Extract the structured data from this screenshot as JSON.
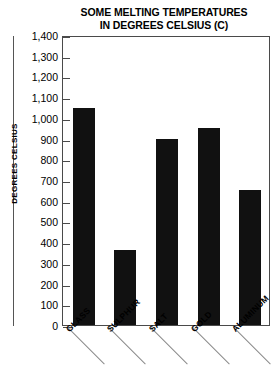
{
  "chart_data": {
    "type": "bar",
    "title": "SOME MELTING TEMPERATURES IN DEGREES CELSIUS (C)",
    "title_line1": "SOME MELTING TEMPERATURES",
    "title_line2": "IN DEGREES CELSIUS (C)",
    "categories": [
      "GLASS",
      "SULPHUR",
      "SALT",
      "GOLD",
      "ALUMINUM"
    ],
    "values": [
      1050,
      360,
      900,
      950,
      650
    ],
    "xlabel": "",
    "ylabel": "DEGREES CELSIUS",
    "ylim": [
      0,
      1400
    ],
    "ytick_step": 100,
    "ytick_labels": [
      "1,400",
      "1,300",
      "1,200",
      "1,100",
      "1,000",
      "900",
      "800",
      "700",
      "600",
      "500",
      "400",
      "300",
      "200",
      "100",
      "0"
    ],
    "ytick_values": [
      1400,
      1300,
      1200,
      1100,
      1000,
      900,
      800,
      700,
      600,
      500,
      400,
      300,
      200,
      100,
      0
    ],
    "grid": false,
    "legend": "none",
    "bar_color": "#111111",
    "axis_color": "#4a4a4a",
    "background": "#ffffff"
  }
}
